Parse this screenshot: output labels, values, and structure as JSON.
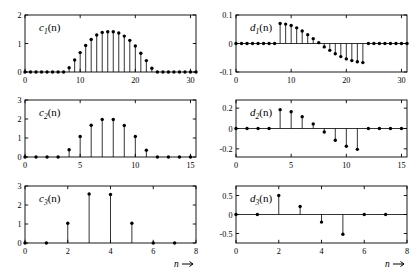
{
  "figure": {
    "title": "",
    "background": "#ffffff",
    "stem_color": "#000000",
    "axis_color": "#000000"
  },
  "axis_arrow_label": "n",
  "panels": [
    {
      "id": "c1",
      "label_base": "c",
      "label_sub": "1",
      "label_tail": "(n)",
      "x_ticks": [
        0,
        10,
        20,
        30
      ],
      "y_ticks": [
        0,
        1,
        2
      ],
      "xlim": [
        0,
        31
      ],
      "ylim": [
        0,
        2
      ],
      "xlabel": "",
      "show_arrow_label": false
    },
    {
      "id": "c2",
      "label_base": "c",
      "label_sub": "2",
      "label_tail": "(n)",
      "x_ticks": [
        0,
        5,
        10,
        15
      ],
      "y_ticks": [
        0,
        1,
        2,
        3
      ],
      "xlim": [
        0,
        15.5
      ],
      "ylim": [
        0,
        3
      ],
      "xlabel": "",
      "show_arrow_label": false
    },
    {
      "id": "c3",
      "label_base": "c",
      "label_sub": "3",
      "label_tail": "(n)",
      "x_ticks": [
        0,
        2,
        4,
        6,
        8
      ],
      "y_ticks": [
        0,
        1,
        2,
        3
      ],
      "xlim": [
        0,
        8
      ],
      "ylim": [
        0,
        3
      ],
      "xlabel": "n",
      "show_arrow_label": true
    },
    {
      "id": "d1",
      "label_base": "d",
      "label_sub": "1",
      "label_tail": "(n)",
      "x_ticks": [
        0,
        10,
        20,
        30
      ],
      "y_ticks": [
        -0.1,
        0,
        0.1
      ],
      "xlim": [
        0,
        31
      ],
      "ylim": [
        -0.1,
        0.1
      ],
      "xlabel": "",
      "show_arrow_label": false
    },
    {
      "id": "d2",
      "label_base": "d",
      "label_sub": "2",
      "label_tail": "(n)",
      "x_ticks": [
        0,
        5,
        10,
        15
      ],
      "y_ticks": [
        -0.2,
        0,
        0.2
      ],
      "xlim": [
        0,
        15.5
      ],
      "ylim": [
        -0.28,
        0.28
      ],
      "xlabel": "",
      "show_arrow_label": false
    },
    {
      "id": "d3",
      "label_base": "d",
      "label_sub": "3",
      "label_tail": "(n)",
      "x_ticks": [
        0,
        2,
        4,
        6,
        8
      ],
      "y_ticks": [
        -0.5,
        0,
        0.5
      ],
      "xlim": [
        0,
        8
      ],
      "ylim": [
        -0.75,
        0.75
      ],
      "xlabel": "n",
      "show_arrow_label": true
    }
  ],
  "chart_data": [
    {
      "type": "stem",
      "id": "c1",
      "title": "c1(n)",
      "xlabel": "n",
      "ylabel": "",
      "xlim": [
        0,
        31
      ],
      "ylim": [
        0,
        2
      ],
      "x": [
        0,
        1,
        2,
        3,
        4,
        5,
        6,
        7,
        8,
        9,
        10,
        11,
        12,
        13,
        14,
        15,
        16,
        17,
        18,
        19,
        20,
        21,
        22,
        23,
        24,
        25,
        26,
        27,
        28,
        29,
        30,
        31
      ],
      "values": [
        0,
        0,
        0,
        0,
        0,
        0,
        0,
        0,
        0.15,
        0.42,
        0.68,
        0.93,
        1.14,
        1.3,
        1.39,
        1.41,
        1.41,
        1.37,
        1.26,
        1.11,
        0.91,
        0.66,
        0.4,
        0.13,
        0,
        0,
        0,
        0,
        0,
        0,
        0,
        0
      ]
    },
    {
      "type": "stem",
      "id": "c2",
      "title": "c2(n)",
      "xlabel": "n",
      "ylabel": "",
      "xlim": [
        0,
        15.5
      ],
      "ylim": [
        0,
        3
      ],
      "x": [
        0,
        1,
        2,
        3,
        4,
        5,
        6,
        7,
        8,
        9,
        10,
        11,
        12,
        13,
        14,
        15
      ],
      "values": [
        0,
        0,
        0,
        0,
        0.38,
        1.08,
        1.67,
        1.98,
        1.97,
        1.66,
        1.08,
        0.36,
        0,
        0,
        0,
        0
      ]
    },
    {
      "type": "stem",
      "id": "c3",
      "title": "c3(n)",
      "xlabel": "n",
      "ylabel": "",
      "xlim": [
        0,
        8
      ],
      "ylim": [
        0,
        3
      ],
      "x": [
        0,
        1,
        2,
        3,
        4,
        5,
        6,
        7
      ],
      "values": [
        0,
        0,
        1.04,
        2.58,
        2.55,
        1.04,
        0,
        0
      ]
    },
    {
      "type": "stem",
      "id": "d1",
      "title": "d1(n)",
      "xlabel": "n",
      "ylabel": "",
      "xlim": [
        0,
        31
      ],
      "ylim": [
        -0.1,
        0.1
      ],
      "x": [
        0,
        1,
        2,
        3,
        4,
        5,
        6,
        7,
        8,
        9,
        10,
        11,
        12,
        13,
        14,
        15,
        16,
        17,
        18,
        19,
        20,
        21,
        22,
        23,
        24,
        25,
        26,
        27,
        28,
        29,
        30,
        31
      ],
      "values": [
        0,
        0,
        0,
        0,
        0,
        0,
        0,
        0,
        0.07,
        0.068,
        0.063,
        0.055,
        0.044,
        0.031,
        0.017,
        0.003,
        -0.012,
        -0.024,
        -0.036,
        -0.046,
        -0.054,
        -0.06,
        -0.064,
        -0.067,
        0,
        0,
        0,
        0,
        0,
        0,
        0,
        0
      ]
    },
    {
      "type": "stem",
      "id": "d2",
      "title": "d2(n)",
      "xlabel": "n",
      "ylabel": "",
      "xlim": [
        0,
        15.5
      ],
      "ylim": [
        -0.28,
        0.28
      ],
      "x": [
        0,
        1,
        2,
        3,
        4,
        5,
        6,
        7,
        8,
        9,
        10,
        11,
        12,
        13,
        14,
        15
      ],
      "values": [
        0,
        0,
        0,
        0,
        0.185,
        0.165,
        0.115,
        0.045,
        -0.035,
        -0.115,
        -0.175,
        -0.205,
        0,
        0,
        0,
        0
      ]
    },
    {
      "type": "stem",
      "id": "d3",
      "title": "d3(n)",
      "xlabel": "n",
      "ylabel": "",
      "xlim": [
        0,
        8
      ],
      "ylim": [
        -0.75,
        0.75
      ],
      "x": [
        0,
        1,
        2,
        3,
        4,
        5,
        6,
        7
      ],
      "values": [
        0,
        0,
        0.5,
        0.21,
        -0.2,
        -0.52,
        0,
        0
      ]
    }
  ]
}
